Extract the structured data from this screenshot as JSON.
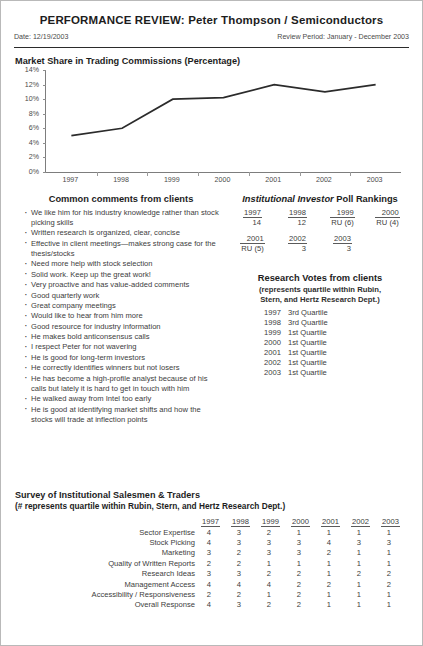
{
  "header": {
    "title": "PERFORMANCE REVIEW:  Peter Thompson / Semiconductors",
    "date_label": "Date:  12/19/2003",
    "review_period_label": "Review Period:  January  -  December 2003"
  },
  "chart": {
    "title": "Market Share in Trading Commissions (Percentage)"
  },
  "chart_data": {
    "type": "line",
    "title": "Market Share in Trading Commissions (Percentage)",
    "xlabel": "",
    "ylabel": "",
    "categories": [
      "1997",
      "1998",
      "1999",
      "2000",
      "2001",
      "2002",
      "2003"
    ],
    "values": [
      5.0,
      6.0,
      10.0,
      10.2,
      12.0,
      11.0,
      12.0
    ],
    "ytick_labels": [
      "0%",
      "2%",
      "4%",
      "6%",
      "8%",
      "10%",
      "12%",
      "14%"
    ],
    "yticks": [
      0,
      2,
      4,
      6,
      8,
      10,
      12,
      14
    ],
    "ylim": [
      0,
      14
    ],
    "grid": false,
    "legend": "none",
    "line_color": "#2b2b2b"
  },
  "comments": {
    "heading": "Common comments from clients",
    "items": [
      "We like him for his industry knowledge rather than stock picking skills",
      "Written research is organized, clear, concise",
      "Effective in client meetings—makes strong case for the thesis/stocks",
      "Need more help with stock selection",
      "Solid work. Keep up the great work!",
      "Very proactive and has value-added comments",
      "Good quarterly work",
      "Great company meetings",
      "Would like to hear from him more",
      "Good resource for industry information",
      "He makes bold anticonsensus calls",
      "I respect Peter for not wavering",
      "He is good for long-term investors",
      "He correctly identifies winners but not losers",
      "He has become a high-profile analyst because of his calls but lately it is hard to get in touch with him",
      "He walked away from Intel too early",
      "He is good at identifying market shifts and how the stocks will trade at inflection points"
    ]
  },
  "poll": {
    "heading_italic": "Institutional Investor",
    "heading_rest": " Poll Rankings",
    "row1": [
      {
        "year": "1997",
        "value": "14"
      },
      {
        "year": "1998",
        "value": "12"
      },
      {
        "year": "1999",
        "value": "RU (6)"
      },
      {
        "year": "2000",
        "value": "RU (4)"
      }
    ],
    "row2": [
      {
        "year": "2001",
        "value": "RU (5)"
      },
      {
        "year": "2002",
        "value": "3"
      },
      {
        "year": "2003",
        "value": "3"
      }
    ]
  },
  "votes": {
    "heading": "Research Votes from clients",
    "sub_line1": "(represents quartile within Rubin,",
    "sub_line2": "Stern, and Hertz Research Dept.)",
    "rows": [
      {
        "year": "1997",
        "quartile": "3rd Quartile"
      },
      {
        "year": "1998",
        "quartile": "3rd Quartile"
      },
      {
        "year": "1999",
        "quartile": "1st Quartile"
      },
      {
        "year": "2000",
        "quartile": "1st Quartile"
      },
      {
        "year": "2001",
        "quartile": "1st Quartile"
      },
      {
        "year": "2002",
        "quartile": "1st Quartile"
      },
      {
        "year": "2003",
        "quartile": "1st Quartile"
      }
    ]
  },
  "survey": {
    "title": "Survey of Institutional Salesmen & Traders",
    "subtitle": "(# represents quartile within Rubin, Stern, and Hertz Research Dept.)",
    "columns": [
      "1997",
      "1998",
      "1999",
      "2000",
      "2001",
      "2002",
      "2003"
    ],
    "rows": [
      {
        "label": "Sector Expertise",
        "values": [
          "4",
          "3",
          "2",
          "1",
          "1",
          "1",
          "1"
        ]
      },
      {
        "label": "Stock Picking",
        "values": [
          "4",
          "3",
          "3",
          "3",
          "4",
          "3",
          "3"
        ]
      },
      {
        "label": "Marketing",
        "values": [
          "3",
          "2",
          "3",
          "3",
          "2",
          "1",
          "1"
        ]
      },
      {
        "label": "Quality of Written Reports",
        "values": [
          "2",
          "2",
          "1",
          "1",
          "1",
          "1",
          "1"
        ]
      },
      {
        "label": "Research Ideas",
        "values": [
          "3",
          "3",
          "2",
          "2",
          "1",
          "2",
          "2"
        ]
      },
      {
        "label": "Management Access",
        "values": [
          "4",
          "4",
          "4",
          "2",
          "2",
          "1",
          "2"
        ]
      },
      {
        "label": "Accessibility / Responsiveness",
        "values": [
          "2",
          "2",
          "1",
          "2",
          "1",
          "1",
          "1"
        ]
      },
      {
        "label": "Overall Response",
        "values": [
          "4",
          "3",
          "2",
          "2",
          "1",
          "1",
          "1"
        ]
      }
    ]
  }
}
